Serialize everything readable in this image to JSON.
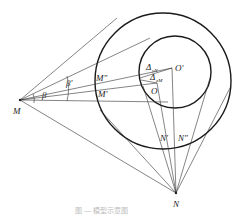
{
  "labels": {
    "M": "M",
    "N": "N",
    "O": "O",
    "O_prime": "O'",
    "M_prime": "M'",
    "M_dprime": "M\"",
    "N_prime": "N'",
    "N_dprime": "N\"",
    "beta": "β",
    "beta_prime": "β'",
    "delta_yN": "Δ",
    "delta_yN_sub": "yN",
    "delta_xM": "Δ",
    "delta_xM_sub": "xM"
  },
  "caption": "图 — 模型示意图"
}
